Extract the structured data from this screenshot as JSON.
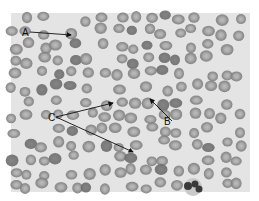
{
  "figure": {
    "type": "blood-smear-micrograph",
    "background_color": "#e6e6e6",
    "cell_color": "#8c8c8c",
    "cell_center_color": "#b4b4b4",
    "annotation_color": "#111111"
  },
  "labels": [
    {
      "id": "A",
      "text": "A",
      "x": 22,
      "y": 36,
      "arrows": [
        {
          "to_x": 71,
          "to_y": 35
        }
      ]
    },
    {
      "id": "B",
      "text": "B",
      "x": 164,
      "y": 125,
      "arrows": [
        {
          "to_x": 150,
          "to_y": 99
        }
      ]
    },
    {
      "id": "C",
      "text": "C",
      "x": 48,
      "y": 121,
      "arrows": [
        {
          "to_x": 113,
          "to_y": 103
        },
        {
          "to_x": 133,
          "to_y": 152
        }
      ]
    }
  ]
}
